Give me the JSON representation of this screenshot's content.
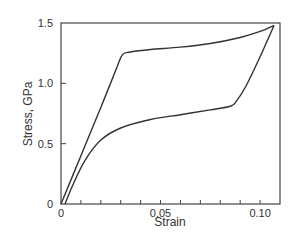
{
  "chart_data": {
    "type": "line",
    "title": "",
    "xlabel": "Strain",
    "ylabel": "Stress, GPa",
    "xlim": [
      0,
      0.11
    ],
    "ylim": [
      0,
      1.5
    ],
    "x_ticks": [
      {
        "value": 0,
        "label": "0"
      },
      {
        "value": 0.05,
        "label": "0.05"
      },
      {
        "value": 0.1,
        "label": "0.10"
      }
    ],
    "y_ticks": [
      {
        "value": 0,
        "label": "0"
      },
      {
        "value": 0.5,
        "label": "0.5"
      },
      {
        "value": 1.0,
        "label": "1.0"
      },
      {
        "value": 1.5,
        "label": "1.5"
      }
    ],
    "grid": false,
    "legend": null,
    "series": [
      {
        "name": "Loading",
        "x": [
          0,
          0.01,
          0.02,
          0.028,
          0.031,
          0.035,
          0.045,
          0.06,
          0.075,
          0.09,
          0.1,
          0.107
        ],
        "y": [
          0,
          0.4,
          0.8,
          1.13,
          1.24,
          1.26,
          1.28,
          1.3,
          1.33,
          1.38,
          1.43,
          1.48
        ]
      },
      {
        "name": "Unloading",
        "x": [
          0.107,
          0.1,
          0.093,
          0.088,
          0.085,
          0.075,
          0.06,
          0.045,
          0.03,
          0.02,
          0.012,
          0.006,
          0.002
        ],
        "y": [
          1.48,
          1.22,
          0.98,
          0.85,
          0.81,
          0.78,
          0.74,
          0.7,
          0.63,
          0.53,
          0.36,
          0.16,
          0
        ]
      }
    ]
  }
}
